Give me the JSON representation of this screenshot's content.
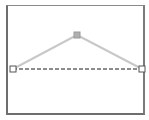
{
  "canvas": {
    "background": "#ffffff",
    "frame_color": "#6e6e6e"
  },
  "shape": {
    "type": "polyline-triangle",
    "edge_color": "#c8c8c8",
    "baseline_color": "#8c8c8c",
    "baseline_style": "dashed",
    "points": {
      "left": {
        "x": 13,
        "y": 69,
        "handle": "hollow-square"
      },
      "apex": {
        "x": 77,
        "y": 35,
        "handle": "filled-square"
      },
      "right": {
        "x": 142,
        "y": 69,
        "handle": "hollow-square"
      }
    }
  }
}
